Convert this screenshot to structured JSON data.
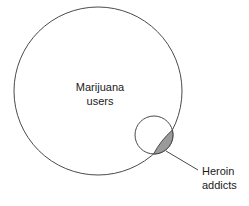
{
  "diagram": {
    "type": "venn",
    "background_color": "#ffffff",
    "stroke_color": "#4a4a4a",
    "text_color": "#1a1a1a",
    "overlap_fill_color": "#9a9a9a",
    "sets": [
      {
        "id": "marijuana-users",
        "label_line1": "Marijuana",
        "label_line2": "users",
        "label_placement": "inside",
        "cx": 98,
        "cy": 91,
        "r": 84,
        "label_x": 100,
        "label_y1": 91,
        "label_y2": 105
      },
      {
        "id": "heroin-addicts",
        "label_line1": "Heroin",
        "label_line2": "addicts",
        "label_placement": "outside",
        "cx": 154,
        "cy": 135,
        "r": 19,
        "label_x": 202,
        "label_y1": 175,
        "label_y2": 189
      }
    ],
    "overlap": {
      "id": "marijuana-and-heroin",
      "description": "intersection of heroin addicts and marijuana users",
      "fill": "#9a9a9a",
      "path": "M 148.4 116.5 A 19 19 0 0 0 140.9 150.9 A 84 84 0 0 0 148.4 116.5 Z"
    },
    "leader": {
      "id": "heroin-addicts-leader",
      "x1": 166,
      "y1": 151,
      "x2": 198,
      "y2": 170
    }
  }
}
